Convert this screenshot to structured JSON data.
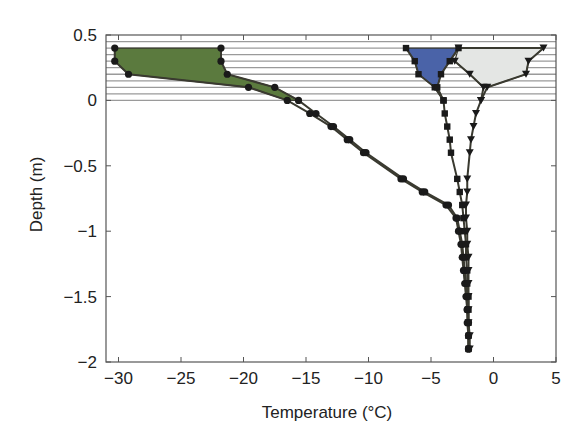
{
  "chart_data": {
    "type": "line",
    "title": "",
    "xlabel": "Temperature (°C)",
    "ylabel": "Depth (m)",
    "xlim": [
      -31,
      5
    ],
    "ylim": [
      -2,
      0.5
    ],
    "xticks": [
      -30,
      -25,
      -20,
      -15,
      -10,
      -5,
      0,
      5
    ],
    "xtick_labels": [
      "−30",
      "−25",
      "−20",
      "−15",
      "−10",
      "−5",
      "0",
      "5"
    ],
    "yticks": [
      0.5,
      0,
      -0.5,
      -1,
      -1.5,
      -2
    ],
    "ytick_labels": [
      "0.5",
      "0",
      "−0.5",
      "−1",
      "−1.5",
      "−2"
    ],
    "grid": false,
    "snow_layer_hatch": {
      "from": 0,
      "to": 0.45,
      "spacing": 0.05
    },
    "colors": {
      "green_fill": "#5b7a3e",
      "blue_fill": "#4a63a8",
      "gray_fill": "#e4e6e4",
      "line": "#3a3a30",
      "marker": "#1a1a1a",
      "hatch": "#9a9a9a"
    },
    "series": [
      {
        "name": "cold-profile-circles",
        "marker": "circle",
        "points": [
          [
            -30.3,
            0.4
          ],
          [
            -30.3,
            0.3
          ],
          [
            -29.2,
            0.2
          ],
          [
            -19.6,
            0.1
          ],
          [
            -16.5,
            0
          ],
          [
            -14.7,
            -0.1
          ],
          [
            -13.0,
            -0.2
          ],
          [
            -11.7,
            -0.3
          ],
          [
            -10.4,
            -0.4
          ],
          [
            -7.4,
            -0.6
          ],
          [
            -5.7,
            -0.7
          ],
          [
            -3.8,
            -0.8
          ],
          [
            -3.0,
            -0.9
          ],
          [
            -2.8,
            -1.0
          ],
          [
            -2.6,
            -1.1
          ],
          [
            -2.5,
            -1.2
          ],
          [
            -2.4,
            -1.3
          ],
          [
            -2.3,
            -1.4
          ],
          [
            -2.2,
            -1.5
          ],
          [
            -2.1,
            -1.6
          ],
          [
            -2.1,
            -1.7
          ],
          [
            -2.0,
            -1.8
          ],
          [
            -2.0,
            -1.9
          ]
        ]
      },
      {
        "name": "cold-profile-circles-2",
        "marker": "circle",
        "points": [
          [
            -21.8,
            0.4
          ],
          [
            -21.8,
            0.3
          ],
          [
            -21.3,
            0.2
          ],
          [
            -17.5,
            0.1
          ],
          [
            -15.6,
            0
          ],
          [
            -14.2,
            -0.1
          ],
          [
            -12.8,
            -0.2
          ],
          [
            -11.5,
            -0.3
          ],
          [
            -10.2,
            -0.4
          ],
          [
            -7.2,
            -0.6
          ],
          [
            -5.5,
            -0.7
          ],
          [
            -3.6,
            -0.8
          ],
          [
            -2.9,
            -0.9
          ],
          [
            -2.7,
            -1.0
          ],
          [
            -2.5,
            -1.1
          ],
          [
            -2.4,
            -1.2
          ],
          [
            -2.3,
            -1.3
          ],
          [
            -2.2,
            -1.4
          ],
          [
            -2.1,
            -1.5
          ],
          [
            -2.1,
            -1.6
          ],
          [
            -2.0,
            -1.7
          ],
          [
            -2.0,
            -1.8
          ],
          [
            -2.0,
            -1.9
          ]
        ]
      },
      {
        "name": "profile-squares-left",
        "marker": "square",
        "points": [
          [
            -7.0,
            0.4
          ],
          [
            -6.3,
            0.3
          ],
          [
            -6.0,
            0.2
          ],
          [
            -4.7,
            0.1
          ],
          [
            -4.0,
            0
          ],
          [
            -3.9,
            -0.1
          ],
          [
            -3.7,
            -0.2
          ],
          [
            -3.5,
            -0.3
          ],
          [
            -3.4,
            -0.4
          ],
          [
            -2.9,
            -0.6
          ],
          [
            -2.7,
            -0.7
          ],
          [
            -2.5,
            -0.8
          ],
          [
            -2.4,
            -0.9
          ],
          [
            -2.3,
            -1.0
          ],
          [
            -2.2,
            -1.1
          ],
          [
            -2.2,
            -1.2
          ],
          [
            -2.1,
            -1.3
          ],
          [
            -2.1,
            -1.4
          ],
          [
            -2.0,
            -1.5
          ],
          [
            -2.0,
            -1.6
          ],
          [
            -2.0,
            -1.7
          ],
          [
            -2.0,
            -1.8
          ],
          [
            -2.0,
            -1.9
          ]
        ]
      },
      {
        "name": "profile-squares-right",
        "marker": "square",
        "points": [
          [
            -2.8,
            0.4
          ],
          [
            -3.5,
            0.3
          ],
          [
            -4.2,
            0.2
          ],
          [
            -4.5,
            0.1
          ],
          [
            -4.0,
            0
          ]
        ]
      },
      {
        "name": "profile-triangles-left",
        "marker": "triangle-down",
        "points": [
          [
            -3.1,
            0.3
          ],
          [
            -1.9,
            0.2
          ],
          [
            -0.8,
            0.1
          ],
          [
            -1.0,
            0
          ],
          [
            -1.4,
            -0.1
          ],
          [
            -1.6,
            -0.2
          ],
          [
            -1.8,
            -0.3
          ],
          [
            -1.9,
            -0.4
          ],
          [
            -2.1,
            -0.6
          ],
          [
            -2.1,
            -0.7
          ],
          [
            -2.2,
            -0.8
          ],
          [
            -2.2,
            -0.9
          ],
          [
            -2.1,
            -1.0
          ],
          [
            -2.1,
            -1.1
          ],
          [
            -2.0,
            -1.2
          ],
          [
            -2.0,
            -1.3
          ],
          [
            -2.0,
            -1.4
          ],
          [
            -2.0,
            -1.5
          ],
          [
            -2.0,
            -1.6
          ],
          [
            -2.0,
            -1.7
          ],
          [
            -1.9,
            -1.8
          ],
          [
            -1.9,
            -1.9
          ]
        ]
      },
      {
        "name": "profile-triangles-right",
        "marker": "triangle-down",
        "points": [
          [
            -2.8,
            0.4
          ],
          [
            4.0,
            0.4
          ],
          [
            2.8,
            0.3
          ],
          [
            2.6,
            0.2
          ],
          [
            -0.5,
            0.1
          ],
          [
            -1.0,
            0
          ]
        ]
      }
    ],
    "fills": [
      {
        "name": "green-envelope",
        "color": "#5b7a3e",
        "polygon": [
          [
            -30.3,
            0.4
          ],
          [
            -21.8,
            0.4
          ],
          [
            -21.8,
            0.3
          ],
          [
            -21.3,
            0.2
          ],
          [
            -17.5,
            0.1
          ],
          [
            -15.6,
            0
          ],
          [
            -16.5,
            0
          ],
          [
            -19.6,
            0.1
          ],
          [
            -29.2,
            0.2
          ],
          [
            -30.3,
            0.3
          ]
        ]
      },
      {
        "name": "blue-envelope",
        "color": "#4a63a8",
        "polygon": [
          [
            -7.0,
            0.4
          ],
          [
            -2.8,
            0.4
          ],
          [
            -3.5,
            0.3
          ],
          [
            -4.2,
            0.2
          ],
          [
            -4.5,
            0.1
          ],
          [
            -4.0,
            0
          ],
          [
            -4.7,
            0.1
          ],
          [
            -6.0,
            0.2
          ],
          [
            -6.3,
            0.3
          ]
        ]
      },
      {
        "name": "gray-envelope",
        "color": "#e4e6e4",
        "polygon": [
          [
            -2.8,
            0.4
          ],
          [
            4.0,
            0.4
          ],
          [
            2.8,
            0.3
          ],
          [
            2.6,
            0.2
          ],
          [
            -0.5,
            0.1
          ],
          [
            -0.8,
            0.1
          ],
          [
            -1.9,
            0.2
          ],
          [
            -3.1,
            0.3
          ]
        ]
      }
    ]
  }
}
